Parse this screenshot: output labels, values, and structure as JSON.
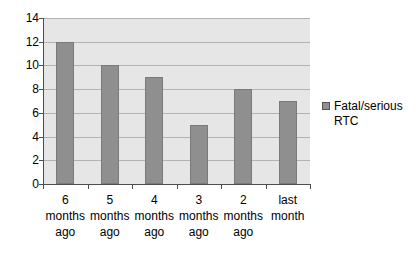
{
  "chart_data": {
    "type": "bar",
    "title": "",
    "subtitle": "",
    "xlabel": "",
    "ylabel": "",
    "categories": [
      "6 months ago",
      "5 months ago",
      "4 months ago",
      "3 months ago",
      "2 months ago",
      "last month"
    ],
    "category_lines": [
      [
        "6",
        "months",
        "ago"
      ],
      [
        "5",
        "months",
        "ago"
      ],
      [
        "4",
        "months",
        "ago"
      ],
      [
        "3",
        "months",
        "ago"
      ],
      [
        "2",
        "months",
        "ago"
      ],
      [
        "last",
        "month"
      ]
    ],
    "series": [
      {
        "name": "Fatal/serious RTC",
        "values": [
          12,
          10,
          9,
          5,
          8,
          7
        ],
        "color": "#8f8f8f"
      }
    ],
    "ylim": [
      0,
      14
    ],
    "ytick_step": 2,
    "ytick_labels": [
      "0",
      "2",
      "4",
      "6",
      "8",
      "10",
      "12",
      "14"
    ],
    "grid": "horizontal",
    "legend_position": "right",
    "legend_entries": [
      {
        "label": "Fatal/serious RTC",
        "color": "#8f8f8f"
      }
    ],
    "plot_background": "#e6e6e6",
    "page_background": "#ffffff",
    "axis_color": "#4d4d4d",
    "gridline_color": "#b3b3b3"
  }
}
